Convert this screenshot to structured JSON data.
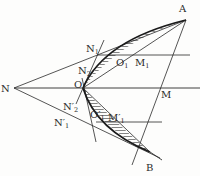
{
  "diagram": {
    "type": "geometric construction",
    "points": {
      "N": {
        "label": "N",
        "x": 14,
        "y": 88
      },
      "O": {
        "label": "O",
        "x": 83,
        "y": 88
      },
      "A": {
        "label": "A",
        "x": 186,
        "y": 20
      },
      "B": {
        "label": "B",
        "x": 150,
        "y": 152
      },
      "M": {
        "label": "M",
        "x": 158,
        "y": 88
      },
      "N1": {
        "label": "N",
        "sub": "1",
        "x": 100,
        "y": 55
      },
      "N2": {
        "label": "N",
        "sub": "2",
        "x": 90,
        "y": 72
      },
      "O1": {
        "label": "O",
        "sub": "1",
        "x": 120,
        "y": 55
      },
      "M1": {
        "label": "M",
        "sub": "1",
        "x": 140,
        "y": 55
      },
      "N2p": {
        "label": "N′",
        "sub": "2",
        "x": 89,
        "y": 108
      },
      "N1p": {
        "label": "N′",
        "sub": "1",
        "x": 97,
        "y": 122
      },
      "O1p": {
        "label": "O′",
        "sub": "1",
        "x": 120,
        "y": 122
      },
      "M1p": {
        "label": "M′",
        "sub": "1",
        "x": 140,
        "y": 122
      }
    },
    "colors": {
      "line": "#2a2a2a",
      "background": "#fdfdfc"
    }
  }
}
